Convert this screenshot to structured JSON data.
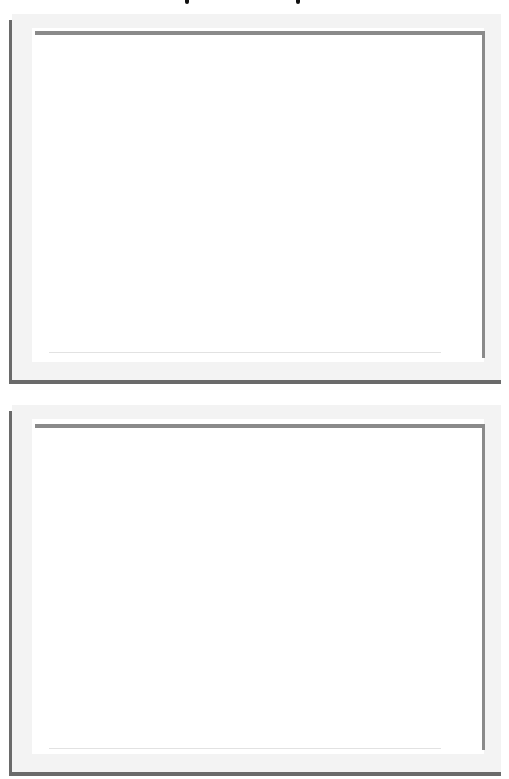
{
  "page": {
    "background": "#ffffff",
    "top_marks": [
      {
        "x": 185
      },
      {
        "x": 296
      }
    ]
  },
  "frames": [
    {
      "name": "frame-1",
      "top": 14,
      "height": 370,
      "inner_top": 17,
      "inner_right_height": 327
    },
    {
      "name": "frame-2",
      "top": 405,
      "height": 371,
      "inner_top": 19,
      "inner_right_height": 326
    }
  ],
  "colors": {
    "frame_dark": "#6a6a6a",
    "frame_inner": "#8a8a8a",
    "paper": "#f3f3f3",
    "content": "#ffffff"
  }
}
